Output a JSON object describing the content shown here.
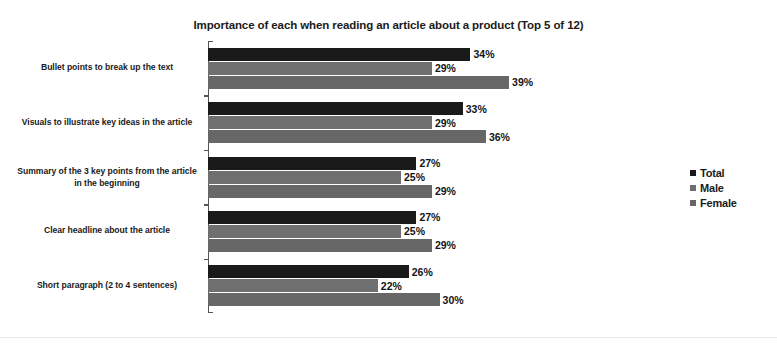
{
  "chart_data": {
    "type": "bar",
    "orientation": "horizontal",
    "title": "Importance of each when reading an article about a product (Top 5 of 12)",
    "xlabel": "",
    "ylabel": "",
    "grid": false,
    "legend_position": "right",
    "xlim": [
      0,
      60
    ],
    "categories": [
      "Bullet points to break up the text",
      "Visuals to illustrate key ideas in the article",
      "Summary of the 3 key points from the article in the beginning",
      "Clear headline about the article",
      "Short paragraph (2 to 4 sentences)"
    ],
    "series": [
      {
        "name": "Total",
        "color": "#1a1a1a",
        "values": [
          34,
          33,
          27,
          27,
          26
        ],
        "labels": [
          "34%",
          "33%",
          "27%",
          "27%",
          "26%"
        ]
      },
      {
        "name": "Male",
        "color": "#6f6f6f",
        "values": [
          29,
          29,
          25,
          25,
          22
        ],
        "labels": [
          "29%",
          "29%",
          "25%",
          "25%",
          "22%"
        ]
      },
      {
        "name": "Female",
        "color": "#676767",
        "values": [
          39,
          36,
          29,
          29,
          30
        ],
        "labels": [
          "39%",
          "36%",
          "29%",
          "29%",
          "30%"
        ]
      }
    ]
  },
  "legend": {
    "items": [
      {
        "label": "Total",
        "color": "#1a1a1a"
      },
      {
        "label": "Male",
        "color": "#6f6f6f"
      },
      {
        "label": "Female",
        "color": "#676767"
      }
    ]
  }
}
